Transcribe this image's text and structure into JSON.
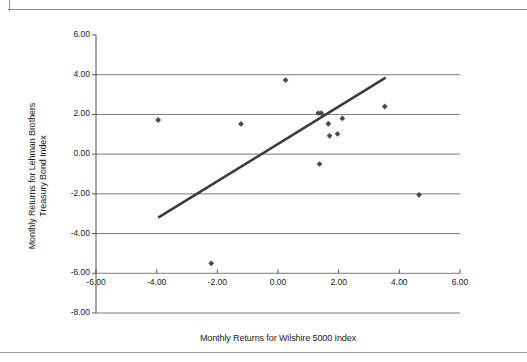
{
  "chart_data": {
    "type": "scatter",
    "title": "",
    "subtitle": "",
    "xlabel": "Monthly Returns for Wilshire 5000 Index",
    "ylabel": "Monthly Returns for Lehman Brothers\nTreasury Bond Index",
    "xlim": [
      -6.0,
      6.0
    ],
    "ylim": [
      -8.0,
      6.0
    ],
    "xticks": [
      -6.0,
      -4.0,
      -2.0,
      0.0,
      2.0,
      4.0,
      6.0
    ],
    "yticks": [
      6.0,
      4.0,
      2.0,
      0.0,
      -2.0,
      -4.0,
      -6.0,
      -8.0
    ],
    "xtick_labels": [
      "-6.00",
      "-4.00",
      "-2.00",
      "0.00",
      "2.00",
      "4.00",
      "6.00"
    ],
    "ytick_labels": [
      "6.00",
      "4.00",
      "2.00",
      "0.00",
      "-2.00",
      "-4.00",
      "-6.00",
      "-8.00"
    ],
    "grid": "horizontal",
    "legend": "none",
    "marker": "diamond",
    "marker_color": "#4a4a4a",
    "series": [
      {
        "name": "Monthly returns",
        "points": [
          {
            "x": -3.95,
            "y": 1.72
          },
          {
            "x": -2.2,
            "y": -5.5
          },
          {
            "x": -1.22,
            "y": 1.52
          },
          {
            "x": 0.25,
            "y": 3.73
          },
          {
            "x": 1.33,
            "y": 2.07
          },
          {
            "x": 1.37,
            "y": -0.5
          },
          {
            "x": 1.43,
            "y": 2.06
          },
          {
            "x": 1.66,
            "y": 1.53
          },
          {
            "x": 1.7,
            "y": 0.92
          },
          {
            "x": 1.96,
            "y": 1.02
          },
          {
            "x": 2.12,
            "y": 1.8
          },
          {
            "x": 3.52,
            "y": 2.4
          },
          {
            "x": 4.65,
            "y": -2.05
          }
        ]
      }
    ],
    "trendline": {
      "name": "Linear fit",
      "color": "#3c3c3c",
      "width": 2.6,
      "x0": -3.95,
      "y0": -3.2,
      "x1": 3.55,
      "y1": 3.85
    },
    "axis_color": "#555555",
    "grid_color": "#6b6b6b"
  }
}
